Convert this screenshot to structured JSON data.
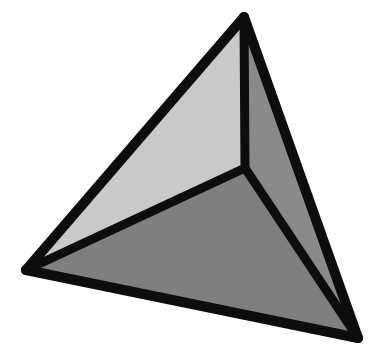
{
  "figure": {
    "name": "tetrahedron",
    "background_color": "#ffffff",
    "canvas": {
      "width": 385,
      "height": 363
    },
    "edge_color": "#0d0d0d",
    "edge_width": 9,
    "edge_width_outer": 10,
    "vertices": {
      "apex": {
        "label": "apex",
        "x": 244,
        "y": 17
      },
      "left": {
        "label": "left",
        "x": 26,
        "y": 270
      },
      "bottom_right": {
        "label": "bottom-right",
        "x": 358,
        "y": 338
      },
      "interior": {
        "label": "interior",
        "x": 245,
        "y": 168
      }
    },
    "faces": [
      {
        "name": "left-face",
        "label": "Left face",
        "fill": "#c9c9c9",
        "points": "244,17 26,270 245,168"
      },
      {
        "name": "bottom-face",
        "label": "Bottom face",
        "fill": "#7f7f7f",
        "points": "26,270 358,338 245,168"
      },
      {
        "name": "right-face",
        "label": "Right face",
        "fill": "#8a8a8a",
        "points": "244,17 245,168 358,338"
      }
    ],
    "edges": [
      {
        "name": "edge-apex-left",
        "label": "apex to left",
        "x1": 244,
        "y1": 17,
        "x2": 26,
        "y2": 270,
        "width": 10
      },
      {
        "name": "edge-left-bottomright",
        "label": "left to bottom-right",
        "x1": 26,
        "y1": 270,
        "x2": 358,
        "y2": 338,
        "width": 10
      },
      {
        "name": "edge-bottomright-apex",
        "label": "bottom-right to apex",
        "x1": 358,
        "y1": 338,
        "x2": 244,
        "y2": 17,
        "width": 10
      },
      {
        "name": "edge-apex-interior",
        "label": "apex to interior",
        "x1": 244,
        "y1": 17,
        "x2": 245,
        "y2": 168,
        "width": 9
      },
      {
        "name": "edge-interior-left",
        "label": "interior to left",
        "x1": 245,
        "y1": 168,
        "x2": 26,
        "y2": 270,
        "width": 9
      },
      {
        "name": "edge-interior-bottomright",
        "label": "interior to bottom-right",
        "x1": 245,
        "y1": 168,
        "x2": 358,
        "y2": 338,
        "width": 9
      }
    ]
  }
}
